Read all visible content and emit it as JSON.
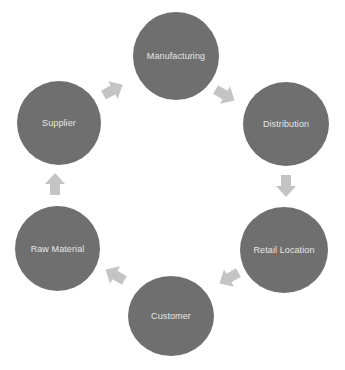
{
  "diagram": {
    "type": "cycle",
    "colors": {
      "node_fill": "#6f6f6f",
      "node_text": "#e6e6e6",
      "arrow_fill": "#c4c4c4",
      "background": "#ffffff"
    },
    "nodes": [
      {
        "id": "manufacturing",
        "label": "Manufacturing"
      },
      {
        "id": "distribution",
        "label": "Distribution"
      },
      {
        "id": "retail-location",
        "label": "Retail Location"
      },
      {
        "id": "customer",
        "label": "Customer"
      },
      {
        "id": "raw-material",
        "label": "Raw Material"
      },
      {
        "id": "supplier",
        "label": "Supplier"
      }
    ],
    "edges": [
      {
        "from": "Manufacturing",
        "to": "Distribution"
      },
      {
        "from": "Distribution",
        "to": "Retail Location"
      },
      {
        "from": "Retail Location",
        "to": "Customer"
      },
      {
        "from": "Customer",
        "to": "Raw Material"
      },
      {
        "from": "Raw Material",
        "to": "Supplier"
      },
      {
        "from": "Supplier",
        "to": "Manufacturing"
      }
    ]
  }
}
